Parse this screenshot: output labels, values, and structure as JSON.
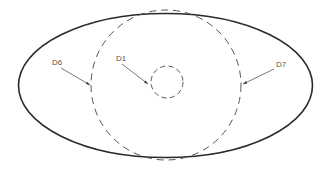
{
  "diagram": {
    "outer_ellipse": {
      "cx": 165.5,
      "cy": 85.5,
      "rx": 147,
      "ry": 72,
      "stroke": "#2a2a2a",
      "stroke_width": 1.6,
      "style": "solid"
    },
    "large_dashed_circle": {
      "cx": 166,
      "cy": 85,
      "r": 75,
      "stroke": "#555555",
      "stroke_width": 1,
      "style": "dashed"
    },
    "small_dashed_circle": {
      "cx": 167,
      "cy": 82,
      "r": 16,
      "stroke": "#555555",
      "stroke_width": 1,
      "style": "dashed"
    },
    "labels": [
      {
        "id": "D6",
        "text": "D6",
        "x": 52,
        "y": 65,
        "leader": {
          "x1": 61,
          "y1": 68,
          "x2": 90,
          "y2": 85
        }
      },
      {
        "id": "D1",
        "text": "D1",
        "x": 116,
        "y": 61,
        "leader": {
          "x1": 122,
          "y1": 64,
          "x2": 148,
          "y2": 84
        }
      },
      {
        "id": "D7",
        "text": "D7",
        "x": 276,
        "y": 67,
        "leader": {
          "x1": 274,
          "y1": 69,
          "x2": 243,
          "y2": 84
        }
      }
    ]
  }
}
